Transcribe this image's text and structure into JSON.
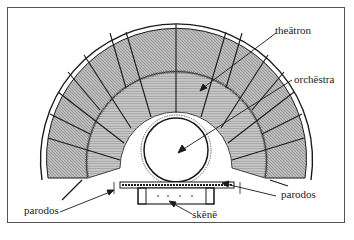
{
  "diagram": {
    "type": "architectural-plan",
    "labels": {
      "theatron": "theātron",
      "orchestra": "orchēstra",
      "parodos_left": "parodos",
      "parodos_right": "parodos",
      "skene": "skēnē"
    },
    "colors": {
      "line": "#1a1a1a",
      "seating": "#9a9a9a",
      "frame": "#555555",
      "background": "#ffffff"
    }
  }
}
